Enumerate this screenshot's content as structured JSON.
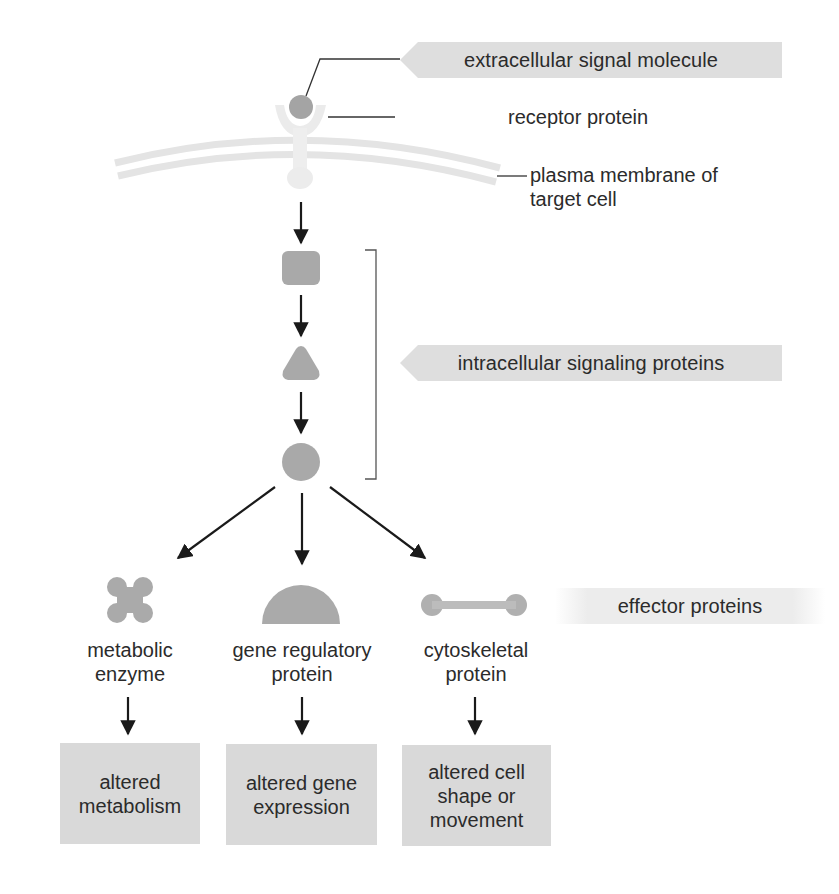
{
  "diagram": {
    "title": "",
    "colors": {
      "shape_fill": "#a9a9a9",
      "signal_molecule": "#a0a0a0",
      "receptor": "#eaeaea",
      "membrane": "#e6e6e6",
      "tag_fill": "#dedede",
      "outcome_fill": "#d9d9d9",
      "arrow": "#1a1a1a"
    },
    "tags": {
      "extracellular": "extracellular signal molecule",
      "intracellular": "intracellular signaling proteins",
      "effector": "effector proteins"
    },
    "labels": {
      "receptor": "receptor protein",
      "membrane_line1": "plasma membrane of",
      "membrane_line2": "target cell"
    },
    "intracellular_proteins": [
      {
        "shape": "rounded-square"
      },
      {
        "shape": "triangle"
      },
      {
        "shape": "circle"
      }
    ],
    "effectors": [
      {
        "shape": "cross-blob",
        "line1": "metabolic",
        "line2": "enzyme"
      },
      {
        "shape": "half-disc",
        "line1": "gene regulatory",
        "line2": "protein"
      },
      {
        "shape": "dumbbell",
        "line1": "cytoskeletal",
        "line2": "protein"
      }
    ],
    "outcomes": [
      {
        "line1": "altered",
        "line2": "metabolism",
        "line3": ""
      },
      {
        "line1": "altered gene",
        "line2": "expression",
        "line3": ""
      },
      {
        "line1": "altered cell",
        "line2": "shape or",
        "line3": "movement"
      }
    ]
  }
}
